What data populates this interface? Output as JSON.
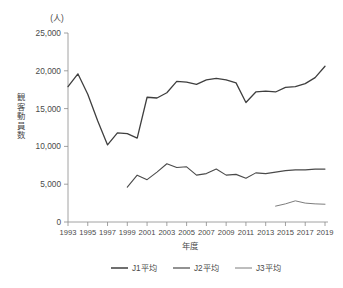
{
  "chart_data": {
    "type": "line",
    "title": "",
    "xlabel": "年度",
    "ylabel": "観客動員数",
    "unit_label": "(人)",
    "ylim": [
      0,
      25000
    ],
    "y_ticks": [
      0,
      5000,
      10000,
      15000,
      20000,
      25000
    ],
    "y_tick_labels": [
      "0",
      "5,000",
      "10,000",
      "15,000",
      "20,000",
      "25,000"
    ],
    "xlim": [
      1993,
      2019
    ],
    "x_ticks": [
      1993,
      1995,
      1997,
      1999,
      2001,
      2003,
      2005,
      2007,
      2009,
      2011,
      2013,
      2015,
      2017,
      2019
    ],
    "x_tick_labels": [
      "1993",
      "1995",
      "1997",
      "1999",
      "2001",
      "2003",
      "2005",
      "2007",
      "2009",
      "2011",
      "2013",
      "2015",
      "2017",
      "2019"
    ],
    "grid": false,
    "legend_position": "bottom",
    "series": [
      {
        "name": "J1平均",
        "color": "#3f3f3f",
        "width": 1.3,
        "x": [
          1993,
          1994,
          1995,
          1996,
          1997,
          1998,
          1999,
          2000,
          2001,
          2002,
          2003,
          2004,
          2005,
          2006,
          2007,
          2008,
          2009,
          2010,
          2011,
          2012,
          2013,
          2014,
          2015,
          2016,
          2017,
          2018,
          2019
        ],
        "values": [
          17900,
          19600,
          16900,
          13400,
          10200,
          11800,
          11700,
          11100,
          16500,
          16400,
          17100,
          18600,
          18500,
          18200,
          18800,
          19000,
          18800,
          18400,
          15800,
          17200,
          17300,
          17200,
          17800,
          17900,
          18300,
          19100,
          20600
        ]
      },
      {
        "name": "J2平均",
        "color": "#4a4a4a",
        "width": 1.1,
        "x": [
          1999,
          2000,
          2001,
          2002,
          2003,
          2004,
          2005,
          2006,
          2007,
          2008,
          2009,
          2010,
          2011,
          2012,
          2013,
          2014,
          2015,
          2016,
          2017,
          2018,
          2019
        ],
        "values": [
          4600,
          6200,
          5600,
          6600,
          7700,
          7200,
          7300,
          6200,
          6400,
          7000,
          6200,
          6300,
          5800,
          6500,
          6400,
          6600,
          6800,
          6900,
          6900,
          7000,
          7000
        ]
      },
      {
        "name": "J3平均",
        "color": "#7d7d7d",
        "width": 1.0,
        "x": [
          2014,
          2015,
          2016,
          2017,
          2018,
          2019
        ],
        "values": [
          2100,
          2400,
          2800,
          2500,
          2400,
          2350
        ]
      }
    ]
  },
  "legend": {
    "items": [
      {
        "label": "J1平均",
        "color": "#3f3f3f",
        "width": 1.5
      },
      {
        "label": "J2平均",
        "color": "#4a4a4a",
        "width": 1.2
      },
      {
        "label": "J3平均",
        "color": "#7d7d7d",
        "width": 1.0
      }
    ]
  }
}
